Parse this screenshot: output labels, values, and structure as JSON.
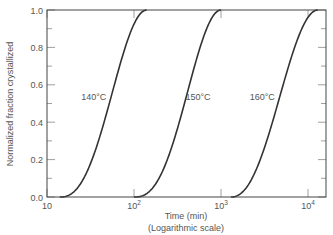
{
  "chart_data": {
    "type": "line",
    "title": "",
    "xlabel": "Time (min)",
    "xlabel_sub": "(Logarithmic scale)",
    "ylabel": "Normalized fraction crystallized",
    "xscale": "log",
    "xlim": [
      10,
      15000
    ],
    "ylim": [
      0.0,
      1.0
    ],
    "x_ticks": [
      {
        "value": 10,
        "label": "10",
        "sup": ""
      },
      {
        "value": 100,
        "label": "10",
        "sup": "2"
      },
      {
        "value": 1000,
        "label": "10",
        "sup": "3"
      },
      {
        "value": 10000,
        "label": "10",
        "sup": "4"
      }
    ],
    "y_ticks": [
      "0.0",
      "0.2",
      "0.4",
      "0.6",
      "0.8",
      "1.0"
    ],
    "grid": false,
    "series": [
      {
        "name": "140°C",
        "label": "140°C",
        "t_start": 14,
        "t_half": 52,
        "t_end": 140,
        "x": [
          14,
          20,
          30,
          40,
          52,
          70,
          90,
          115,
          140
        ],
        "y": [
          0.0,
          0.05,
          0.2,
          0.38,
          0.5,
          0.75,
          0.9,
          0.98,
          1.0
        ]
      },
      {
        "name": "150°C",
        "label": "150°C",
        "t_start": 100,
        "t_half": 380,
        "t_end": 1000,
        "x": [
          100,
          150,
          220,
          300,
          380,
          500,
          650,
          820,
          1000
        ],
        "y": [
          0.0,
          0.05,
          0.2,
          0.38,
          0.5,
          0.75,
          0.9,
          0.98,
          1.0
        ]
      },
      {
        "name": "160°C",
        "label": "160°C",
        "t_start": 1300,
        "t_half": 4500,
        "t_end": 13000,
        "x": [
          1300,
          2000,
          2800,
          3600,
          4500,
          6000,
          8000,
          10500,
          13000
        ],
        "y": [
          0.0,
          0.05,
          0.2,
          0.38,
          0.5,
          0.75,
          0.9,
          0.98,
          1.0
        ]
      }
    ],
    "legend": "inline labels beside curves"
  }
}
